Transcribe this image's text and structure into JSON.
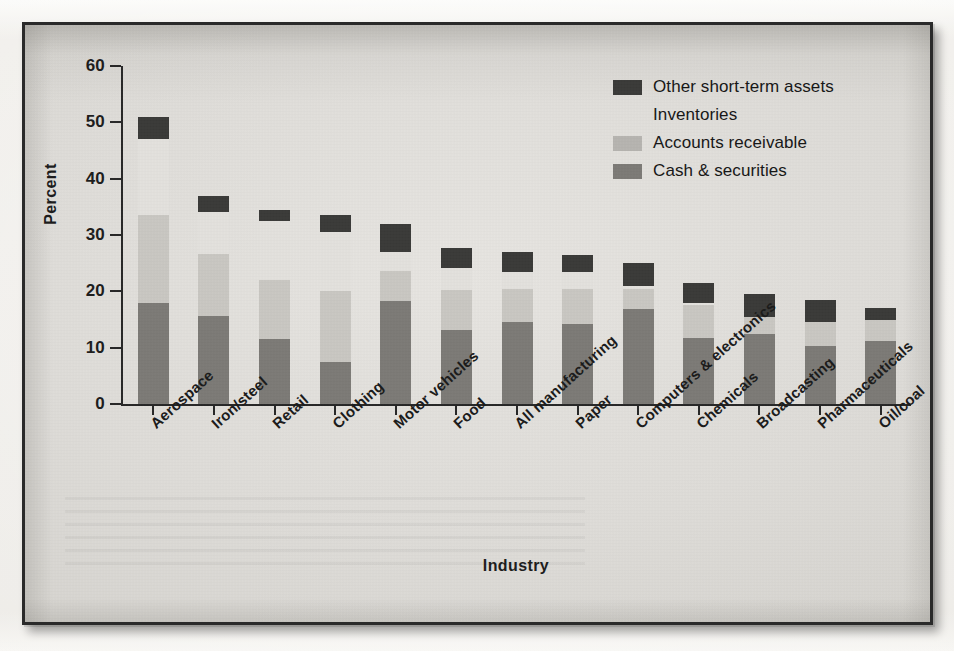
{
  "chart_data": {
    "type": "bar",
    "title": "",
    "subtitle": "",
    "xlabel": "Industry",
    "ylabel": "Percent",
    "ylim": [
      0,
      60
    ],
    "yticks": [
      0,
      10,
      20,
      30,
      40,
      50,
      60
    ],
    "ytick_labels": [
      "0",
      "10",
      "20",
      "30",
      "40",
      "50",
      "60"
    ],
    "grid": false,
    "stacked": true,
    "legend_position": "top-right",
    "categories": [
      "Aerospace",
      "Iron/steel",
      "Retail",
      "Clothing",
      "Motor vehicles",
      "Food",
      "All manufacturing",
      "Paper",
      "Computers & electronics",
      "Chemicals",
      "Broadcasting",
      "Pharmaceuticals",
      "Oil/coal"
    ],
    "series": [
      {
        "name": "Cash & securities",
        "color": "#7c7a76",
        "values": [
          18.0,
          15.7,
          11.5,
          7.5,
          18.2,
          13.2,
          14.5,
          14.2,
          16.8,
          11.8,
          12.5,
          10.3,
          11.2
        ]
      },
      {
        "name": "Accounts receivable",
        "color": "#c9c7c2",
        "values": [
          15.5,
          11.0,
          10.5,
          12.5,
          5.5,
          7.0,
          6.0,
          6.3,
          3.7,
          5.7,
          3.0,
          4.2,
          3.8
        ]
      },
      {
        "name": "Inventories",
        "color": "#e3e1dd",
        "values": [
          13.5,
          7.3,
          10.5,
          10.5,
          3.3,
          4.0,
          3.0,
          3.0,
          0.5,
          0.5,
          0.0,
          0.0,
          0.0
        ]
      },
      {
        "name": "Other short-term assets",
        "color": "#3a3a38",
        "values": [
          3.9,
          3.0,
          2.0,
          3.0,
          5.0,
          3.5,
          3.5,
          3.0,
          4.0,
          3.5,
          4.0,
          4.0,
          2.0
        ]
      }
    ],
    "totals": [
      50.9,
      37.0,
      34.5,
      33.5,
      32.0,
      27.7,
      27.0,
      26.5,
      25.0,
      21.5,
      19.5,
      18.5,
      17.0
    ]
  },
  "legend": {
    "items": [
      {
        "label": "Other short-term assets",
        "swatch": "dark"
      },
      {
        "label": "Inventories",
        "swatch": "inventories"
      },
      {
        "label": "Accounts receivable",
        "swatch": "receivable"
      },
      {
        "label": "Cash & securities",
        "swatch": "cash"
      }
    ]
  },
  "axes": {
    "y_title": "Percent",
    "x_title": "Industry"
  },
  "colors": {
    "other_short_term_assets": "#3a3a38",
    "inventories": "#e3e1dd",
    "accounts_receivable": "#c9c7c2",
    "cash_securities": "#7c7a76",
    "axis": "#272727",
    "paper": "#dedcd8",
    "frame": "#2a2a2a"
  }
}
